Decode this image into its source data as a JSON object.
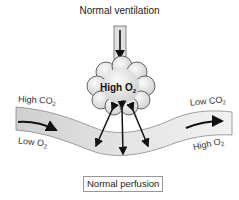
{
  "diagram": {
    "top_label": "Normal ventilation",
    "alveolus_label": {
      "text": "High O",
      "sub": "2"
    },
    "left_top_label": {
      "text": "High CO",
      "sub": "2"
    },
    "left_bottom_label": {
      "text": "Low O",
      "sub": "2"
    },
    "right_top_label": {
      "text": "Low CO",
      "sub": "2"
    },
    "right_bottom_label": {
      "text": "High O",
      "sub": "2"
    },
    "bottom_label": "Normal perfusion",
    "colors": {
      "vessel_fill": "#d9d9d9",
      "vessel_stroke": "#777777",
      "alveolus_fill": "#e6e6e6",
      "alveolus_stroke": "#555555",
      "arrow": "#111111"
    }
  }
}
